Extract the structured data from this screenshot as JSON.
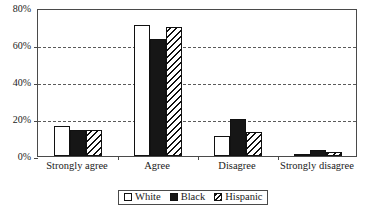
{
  "chart_data": {
    "type": "bar",
    "title": "",
    "subtitle": "",
    "xlabel": "",
    "ylabel": "",
    "categories": [
      "Strongly agree",
      "Agree",
      "Disagree",
      "Strongly disagree"
    ],
    "series": [
      {
        "name": "White",
        "fill": "open",
        "values": [
          16,
          71,
          11,
          1
        ]
      },
      {
        "name": "Black",
        "fill": "solid",
        "values": [
          14,
          63,
          20,
          3
        ]
      },
      {
        "name": "Hispanic",
        "fill": "hatched",
        "values": [
          14,
          70,
          13,
          2
        ]
      }
    ],
    "ylim": [
      0,
      80
    ],
    "ytick_values": [
      0,
      20,
      40,
      60,
      80
    ],
    "ytick_labels": [
      "0%",
      "20%",
      "40%",
      "60%",
      "80%"
    ],
    "grid": "horizontal-dashed",
    "legend_position": "bottom-center",
    "legend_entries": [
      "White",
      "Black",
      "Hispanic"
    ],
    "annotations": []
  },
  "axes": {
    "y": {
      "ticks": [
        {
          "label": "80%",
          "value": 80
        },
        {
          "label": "60%",
          "value": 60
        },
        {
          "label": "40%",
          "value": 40
        },
        {
          "label": "20%",
          "value": 20
        },
        {
          "label": "0%",
          "value": 0
        }
      ]
    },
    "x": {
      "ticks": [
        {
          "label": "Strongly agree"
        },
        {
          "label": "Agree"
        },
        {
          "label": "Disagree"
        },
        {
          "label": "Strongly disagree"
        }
      ]
    }
  },
  "legend": {
    "items": [
      {
        "label": "White",
        "swatch": "open-square-icon"
      },
      {
        "label": "Black",
        "swatch": "filled-square-icon"
      },
      {
        "label": "Hispanic",
        "swatch": "hatched-square-icon"
      }
    ]
  },
  "colors": {
    "series_white": "#ffffff",
    "series_black": "#161616",
    "series_hatch_line": "#111111",
    "axis": "#4a4a4a",
    "grid": "#5a5a5a",
    "text": "#1a1a1a",
    "background": "#ffffff"
  }
}
